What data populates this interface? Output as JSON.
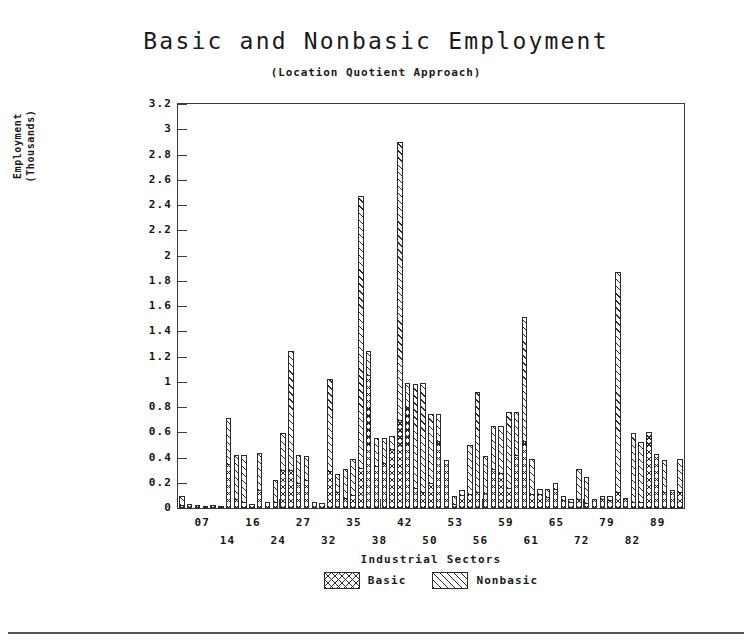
{
  "chart": {
    "title": "Basic and Nonbasic Employment",
    "subtitle": "(Location Quotient Approach)",
    "xlabel": "Industrial Sectors",
    "ylabel": "Employment\n(Thousands)"
  },
  "legend": {
    "items": [
      {
        "label": "Basic",
        "pattern": "cross-hatch"
      },
      {
        "label": "Nonbasic",
        "pattern": "diagonal-hatch"
      }
    ]
  },
  "chart_data": {
    "type": "bar",
    "subtype": "stacked",
    "title": "Basic and Nonbasic Employment",
    "subtitle": "(Location Quotient Approach)",
    "xlabel": "Industrial Sectors",
    "ylabel": "Employment (Thousands)",
    "ylim": [
      0,
      3.2
    ],
    "ytick_step": 0.2,
    "yticks": [
      "0",
      "0.2",
      "0.4",
      "0.6",
      "0.8",
      "1",
      "1.2",
      "1.4",
      "1.6",
      "1.8",
      "2",
      "2.2",
      "2.4",
      "2.6",
      "2.8",
      "3",
      "3.2"
    ],
    "grid": false,
    "legend_position": "bottom-center",
    "xtick_labels_upper": [
      "07",
      "16",
      "27",
      "35",
      "42",
      "53",
      "59",
      "65",
      "79",
      "89"
    ],
    "xtick_labels_lower": [
      "14",
      "24",
      "32",
      "38",
      "50",
      "56",
      "61",
      "72",
      "82"
    ],
    "xtick_labels_ordered": [
      "07",
      "14",
      "16",
      "24",
      "27",
      "32",
      "35",
      "38",
      "42",
      "50",
      "53",
      "56",
      "59",
      "61",
      "65",
      "72",
      "79",
      "82",
      "89"
    ],
    "series": [
      {
        "name": "Basic",
        "values": [
          0.02,
          0.03,
          0.02,
          0.01,
          0.02,
          0.01,
          0.35,
          0.07,
          0.05,
          0.03,
          0.14,
          0.05,
          0.05,
          0.3,
          0.3,
          0.2,
          0.22,
          0.05,
          0.04,
          0.29,
          0.13,
          0.08,
          0.1,
          0.32,
          1.05,
          0.33,
          0.36,
          0.47,
          0.7,
          0.8,
          0.16,
          0.13,
          0.2,
          0.53,
          0.38,
          0.03,
          0.1,
          0.11,
          0.13,
          0.12,
          0.31,
          0.28,
          0.16,
          0.42,
          0.53,
          0.11,
          0.11,
          0.09,
          0.15,
          0.06,
          0.05,
          0.07,
          0.04,
          0.07,
          0.07,
          0.06,
          0.13,
          0.08,
          0.05,
          0.05,
          0.6,
          0.43,
          0.13,
          0.14,
          0.13
        ]
      },
      {
        "name": "Nonbasic",
        "values": [
          0.08,
          0.0,
          0.0,
          0.0,
          0.0,
          0.0,
          0.37,
          0.36,
          0.38,
          0.0,
          0.3,
          0.0,
          0.18,
          0.3,
          0.95,
          0.23,
          0.2,
          0.0,
          0.0,
          0.74,
          0.15,
          0.24,
          0.3,
          2.16,
          0.2,
          0.23,
          0.2,
          0.11,
          2.21,
          0.2,
          0.83,
          0.87,
          0.55,
          0.22,
          0.0,
          0.07,
          0.05,
          0.4,
          0.8,
          0.3,
          0.35,
          0.38,
          0.61,
          0.35,
          0.99,
          0.29,
          0.05,
          0.07,
          0.06,
          0.04,
          0.03,
          0.25,
          0.21,
          0.0,
          0.03,
          0.04,
          1.75,
          0.0,
          0.55,
          0.48,
          0.0,
          0.0,
          0.26,
          0.0,
          0.27
        ]
      }
    ]
  }
}
